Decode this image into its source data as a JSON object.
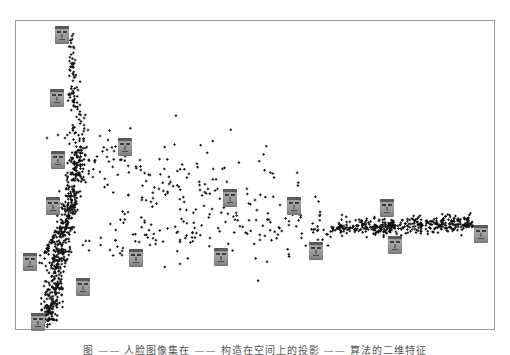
{
  "caption": "图 ——  人脸图像集在 —— 构造在空间上的投影 —— 算法的二维特征",
  "chart_data": {
    "type": "scatter",
    "title": "",
    "xlabel": "",
    "ylabel": "",
    "grid": false,
    "legend": null,
    "axes_visible": false,
    "frame": {
      "left": 15,
      "top": 20,
      "width": 480,
      "height": 310
    },
    "point_color": "#111111",
    "point_marker": "+",
    "clusters": [
      {
        "name": "upper-arm",
        "from": [
          70,
          35
        ],
        "to": [
          78,
          150
        ],
        "n": 90,
        "spread": 6
      },
      {
        "name": "left-dense-arm",
        "from": [
          80,
          150
        ],
        "to": [
          48,
          320
        ],
        "n": 520,
        "spread": 7
      },
      {
        "name": "left-diagonal-streak",
        "from": [
          40,
          262
        ],
        "to": [
          75,
          200
        ],
        "n": 60,
        "spread": 2
      },
      {
        "name": "central-fan",
        "from": [
          85,
          160
        ],
        "to": [
          330,
          235
        ],
        "n": 240,
        "spread": 28
      },
      {
        "name": "lower-fan",
        "from": [
          85,
          245
        ],
        "to": [
          200,
          230
        ],
        "n": 50,
        "spread": 8
      },
      {
        "name": "right-arm",
        "from": [
          330,
          228
        ],
        "to": [
          472,
          223
        ],
        "n": 420,
        "spread": 4
      }
    ],
    "face_thumbnails": [
      {
        "x": 62,
        "y": 35
      },
      {
        "x": 57,
        "y": 98
      },
      {
        "x": 58,
        "y": 160
      },
      {
        "x": 53,
        "y": 206
      },
      {
        "x": 125,
        "y": 147
      },
      {
        "x": 30,
        "y": 262
      },
      {
        "x": 83,
        "y": 287
      },
      {
        "x": 38,
        "y": 322
      },
      {
        "x": 136,
        "y": 258
      },
      {
        "x": 221,
        "y": 257
      },
      {
        "x": 230,
        "y": 198
      },
      {
        "x": 294,
        "y": 206
      },
      {
        "x": 316,
        "y": 251
      },
      {
        "x": 387,
        "y": 208
      },
      {
        "x": 395,
        "y": 245
      },
      {
        "x": 481,
        "y": 234
      }
    ],
    "sample_points": [
      [
        72,
        36
      ],
      [
        74,
        48
      ],
      [
        75,
        60
      ],
      [
        76,
        75
      ],
      [
        78,
        90
      ],
      [
        80,
        105
      ],
      [
        84,
        118
      ],
      [
        88,
        130
      ],
      [
        47,
        138
      ],
      [
        58,
        135
      ],
      [
        65,
        138
      ],
      [
        100,
        136
      ],
      [
        108,
        140
      ],
      [
        140,
        160
      ],
      [
        150,
        175
      ],
      [
        200,
        190
      ],
      [
        255,
        200
      ],
      [
        280,
        205
      ],
      [
        320,
        215
      ],
      [
        342,
        215
      ],
      [
        360,
        222
      ],
      [
        400,
        225
      ],
      [
        430,
        224
      ],
      [
        470,
        224
      ],
      [
        110,
        250
      ],
      [
        150,
        245
      ],
      [
        180,
        240
      ],
      [
        210,
        238
      ],
      [
        260,
        240
      ]
    ]
  }
}
